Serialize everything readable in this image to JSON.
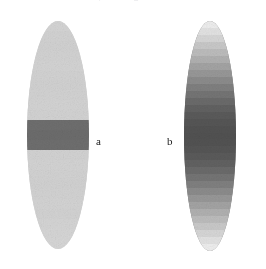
{
  "figure": {
    "background_color": "#ffffff",
    "width": 266,
    "height": 269,
    "top_clipped_text": "of the modulated beam, showing the transverse"
  },
  "panels": [
    {
      "id": "panel-a",
      "label": "a",
      "label_x": 96,
      "label_y": 136,
      "shape": "ellipse",
      "x": 27,
      "y": 21,
      "width": 62,
      "height": 228,
      "base_color": "#d2d2d2",
      "description": "uniform light-gray ellipse with a single dark horizontal band across the center",
      "bands": [
        {
          "stop": 0.0,
          "color": "#d6d6d6"
        },
        {
          "stop": 0.42,
          "color": "#d2d2d2"
        },
        {
          "stop": 0.425,
          "color": "#6e6e6e"
        },
        {
          "stop": 0.545,
          "color": "#6e6e6e"
        },
        {
          "stop": 0.55,
          "color": "#d2d2d2"
        },
        {
          "stop": 1.0,
          "color": "#d6d6d6"
        }
      ],
      "band_rows": [
        "#d4d4d4",
        "#d2d2d2",
        "#d1d1d1",
        "#d2d2d2",
        "#d3d3d3",
        "#d2d2d2",
        "#d1d1d1",
        "#d2d2d2",
        "#d3d3d3",
        "#d2d2d2",
        "#6e6e6e",
        "#6c6c6c",
        "#6e6e6e",
        "#d2d2d2",
        "#d3d3d3",
        "#d2d2d2",
        "#d1d1d1",
        "#d2d2d2",
        "#d3d3d3",
        "#d2d2d2",
        "#d4d4d4",
        "#d5d5d5",
        "#d6d6d6"
      ]
    },
    {
      "id": "panel-b",
      "label": "b",
      "label_x": 167,
      "label_y": 136,
      "shape": "ellipse",
      "x": 184,
      "y": 21,
      "width": 52,
      "height": 230,
      "base_color": "#7a7a7a",
      "description": "ellipse filled with stepped horizontal bands, darkest at the center and fading symmetrically to light gray at top and bottom",
      "band_rows": [
        "#ededed",
        "#e2e2e2",
        "#d6d6d6",
        "#c8c8c8",
        "#bcbcbc",
        "#b0b0b0",
        "#a3a3a3",
        "#979797",
        "#8b8b8b",
        "#7f7f7f",
        "#747474",
        "#6a6a6a",
        "#616161",
        "#5a5a5a",
        "#555555",
        "#525252",
        "#515151",
        "#525252",
        "#555555",
        "#5a5a5a",
        "#616161",
        "#6a6a6a",
        "#747474",
        "#7f7f7f",
        "#8b8b8b",
        "#979797",
        "#a3a3a3",
        "#b0b0b0",
        "#bcbcbc",
        "#c8c8c8",
        "#d6d6d6",
        "#e2e2e2",
        "#ededed"
      ]
    }
  ]
}
